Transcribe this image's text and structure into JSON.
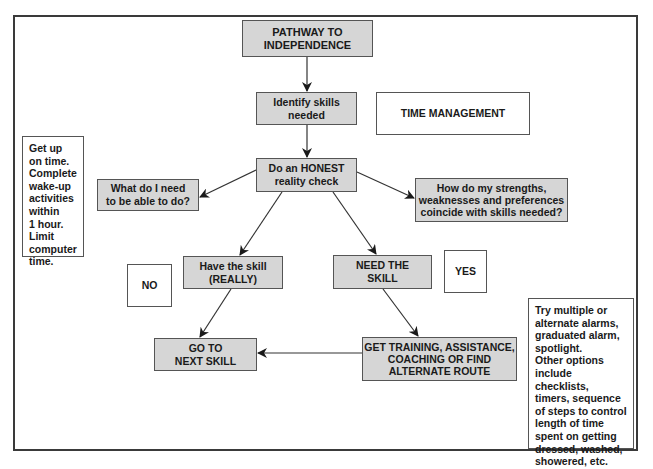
{
  "diagram": {
    "title": "PATHWAY TO\nINDEPENDENCE",
    "topic_label": "TIME MANAGEMENT",
    "nodes": {
      "pathway": "PATHWAY TO\nINDEPENDENCE",
      "identify": "Identify skills\nneeded",
      "honest": "Do an HONEST\nreality check",
      "what_need": "What do I need\nto be able to do?",
      "strengths": "How do my strengths,\nweaknesses and preferences\ncoincide with skills needed?",
      "have_skill": "Have the skill\n(REALLY)",
      "need_skill": "NEED THE\nSKILL",
      "go_next": "GO TO\nNEXT SKILL",
      "get_training": "GET TRAINING, ASSISTANCE,\nCOACHING OR FIND\nALTERNATE ROUTE"
    },
    "labels": {
      "no": "NO",
      "yes": "YES"
    },
    "notes": {
      "left": "Get up\non time.\nComplete\nwake-up\nactivities\nwithin\n1 hour.\nLimit\ncomputer\ntime.",
      "right": "Try multiple or\nalternate alarms,\ngraduated alarm,\nspotlight.\nOther options\ninclude checklists,\ntimers, sequence\nof steps to control\nlength of time\nspent on getting\ndressed, washed,\nshowered, etc."
    },
    "edges": [
      {
        "from": "pathway",
        "to": "identify"
      },
      {
        "from": "identify",
        "to": "honest"
      },
      {
        "from": "honest",
        "to": "what_need"
      },
      {
        "from": "honest",
        "to": "strengths"
      },
      {
        "from": "honest",
        "to": "have_skill"
      },
      {
        "from": "honest",
        "to": "need_skill"
      },
      {
        "from": "have_skill",
        "to": "go_next"
      },
      {
        "from": "need_skill",
        "to": "get_training"
      },
      {
        "from": "get_training",
        "to": "go_next"
      }
    ],
    "colors": {
      "box_fill": "#d6d6d6",
      "border": "#555555",
      "text": "#1a1a1a",
      "frame": "#3a3a3a"
    }
  }
}
